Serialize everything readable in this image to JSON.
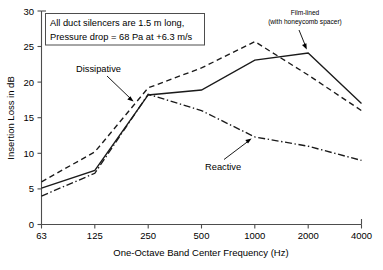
{
  "chart_data": {
    "type": "line",
    "title": "",
    "xlabel": "One-Octave Band Center Frequency (Hz)",
    "ylabel": "Insertion Loss in dB",
    "categories": [
      "63",
      "125",
      "250",
      "500",
      "1000",
      "2000",
      "4000"
    ],
    "x_tick_labels": [
      "63",
      "125",
      "250",
      "500",
      "1000",
      "2000",
      "4000"
    ],
    "y_tick_labels": [
      "0",
      "5",
      "10",
      "15",
      "20",
      "25",
      "30"
    ],
    "y_ticks": [
      0,
      5,
      10,
      15,
      20,
      25,
      30
    ],
    "ylim": [
      0,
      30
    ],
    "grid": false,
    "legend": "none (inline callout labels)",
    "series": [
      {
        "name": "Dissipative",
        "style": "dashed",
        "color": "#1a1a1a",
        "values": [
          6.0,
          10.2,
          19.2,
          22.0,
          25.7,
          21.0,
          16.0
        ]
      },
      {
        "name": "Film-lined (with honeycomb spacer)",
        "style": "solid",
        "color": "#1a1a1a",
        "values": [
          5.1,
          7.6,
          18.2,
          18.9,
          23.1,
          24.1,
          17.0
        ]
      },
      {
        "name": "Reactive",
        "style": "dash-dot",
        "color": "#1a1a1a",
        "values": [
          4.0,
          7.2,
          18.3,
          16.0,
          12.3,
          11.0,
          9.0
        ]
      }
    ],
    "annotations": [
      {
        "id": "note-box",
        "line1": "All duct silencers are 1.5 m long,",
        "line2": "Pressure drop = 68 Pa at +6.3 m/s"
      },
      {
        "id": "callout-dissipative",
        "label": "Dissipative",
        "points_to_series": "Dissipative"
      },
      {
        "id": "callout-reactive",
        "label": "Reactive",
        "points_to_series": "Reactive"
      },
      {
        "id": "callout-film-lined",
        "label_line1": "Film-lined",
        "label_line2": "(with honeycomb spacer)",
        "points_to_series": "Film-lined (with honeycomb spacer)"
      }
    ]
  },
  "axes": {
    "y_title": "Insertion Loss in dB",
    "x_title": "One-Octave Band Center Frequency (Hz)"
  },
  "note": {
    "line1": "All duct silencers are 1.5 m long,",
    "line2": "Pressure drop = 68 Pa at +6.3 m/s"
  },
  "callouts": {
    "dissipative": "Dissipative",
    "reactive": "Reactive",
    "film_lined_line1": "Film-lined",
    "film_lined_line2": "(with honeycomb spacer)"
  },
  "colors": {
    "line": "#1a1a1a",
    "axis": "#4d4d4d",
    "background": "#ffffff",
    "text": "#000000"
  }
}
